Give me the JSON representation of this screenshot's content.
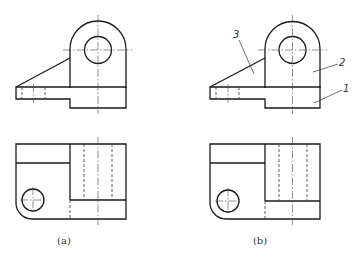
{
  "figure": {
    "type": "engineering-drawing",
    "views": [
      {
        "id": "a",
        "caption": "(a)",
        "annotations": []
      },
      {
        "id": "b",
        "caption": "(b)",
        "annotations": [
          {
            "label": "3",
            "refers_to": "rib"
          },
          {
            "label": "2",
            "refers_to": "upright"
          },
          {
            "label": "1",
            "refers_to": "base"
          }
        ]
      }
    ]
  },
  "labels": {
    "caption_a": "(a)",
    "caption_b": "(b)",
    "part_1": "1",
    "part_2": "2",
    "part_3": "3"
  },
  "colors": {
    "line": "#1a1a1a",
    "background": "#ffffff"
  }
}
